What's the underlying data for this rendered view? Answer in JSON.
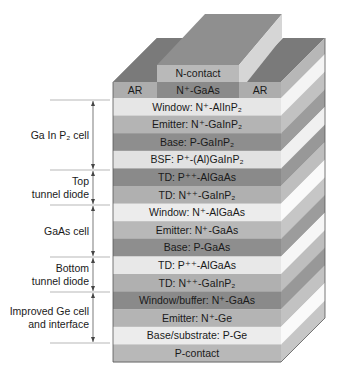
{
  "diagram": {
    "top": {
      "contact": {
        "label": "N-contact",
        "color": "#b9b9b9",
        "top_color": "#8f8f8f",
        "side_color": "#d6d6d6"
      },
      "cap": {
        "label": "N⁺-GaAs",
        "color": "#8a8a8a"
      },
      "ar_left": {
        "label": "AR",
        "color": "#adadad",
        "top_color": "#7a7a7a"
      },
      "ar_right": {
        "label": "AR",
        "color": "#adadad",
        "top_color": "#7a7a7a"
      }
    },
    "layers": [
      {
        "label": "Window: N⁺-AlInP₂",
        "color": "#e6e6e6"
      },
      {
        "label": "Emitter: N⁺-GaInP₂",
        "color": "#b4b4b4"
      },
      {
        "label": "Base: P-GaInP₂",
        "color": "#8e8e8e"
      },
      {
        "label": "BSF: P⁺-(Al)GaInP₂",
        "color": "#e2e2e2"
      },
      {
        "label": "TD: P⁺⁺-AlGaAs",
        "color": "#8a8a8a"
      },
      {
        "label": "TD: N⁺⁺-GaInP₂",
        "color": "#b0b0b0"
      },
      {
        "label": "Window: N⁺-AlGaAs",
        "color": "#ececec"
      },
      {
        "label": "Emitter: N⁺-GaAs",
        "color": "#b8b8b8"
      },
      {
        "label": "Base: P-GaAs",
        "color": "#8e8e8e"
      },
      {
        "label": "TD: P⁺⁺-AlGaAs",
        "color": "#e8e8e8"
      },
      {
        "label": "TD: N⁺⁺-GaInP₂",
        "color": "#b0b0b0"
      },
      {
        "label": "Window/buffer: N⁺-GaAs",
        "color": "#8a8a8a"
      },
      {
        "label": "Emitter: N⁺-Ge",
        "color": "#b4b4b4"
      },
      {
        "label": "Base/substrate: P-Ge",
        "color": "#ececec"
      },
      {
        "label": "P-contact",
        "color": "#b8b8b8"
      }
    ],
    "groups": [
      {
        "lines": [
          "Ga In P₂ cell"
        ],
        "y1": 100,
        "y2": 170
      },
      {
        "lines": [
          "Top",
          "tunnel diode"
        ],
        "y1": 170,
        "y2": 205
      },
      {
        "lines": [
          "GaAs cell"
        ],
        "y1": 205,
        "y2": 257
      },
      {
        "lines": [
          "Bottom",
          "tunnel diode"
        ],
        "y1": 257,
        "y2": 292
      },
      {
        "lines": [
          "Improved Ge cell",
          "and interface"
        ],
        "y1": 292,
        "y2": 343
      }
    ],
    "line_color": "#444444",
    "divider_color": "#9a9a9a"
  }
}
